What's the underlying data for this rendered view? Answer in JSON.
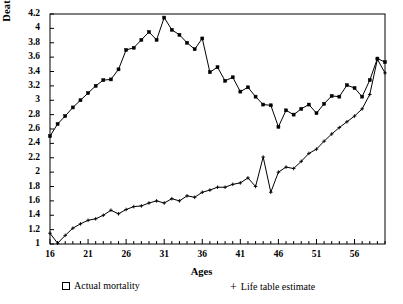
{
  "chart_data": {
    "type": "line",
    "title": "",
    "xlabel": "Ages",
    "ylabel": "Deaths  (thousands)",
    "xlim": [
      16,
      60
    ],
    "ylim": [
      1,
      4.2
    ],
    "ytick_step": 0.2,
    "xtick_step": 5,
    "grid": false,
    "legend_position": "below",
    "yticks": [
      "4.2",
      "4",
      "3.8",
      "3.6",
      "3.4",
      "3.2",
      "3",
      "2.8",
      "2.6",
      "2.4",
      "2.2",
      "2",
      "1.8",
      "1.6",
      "1.4",
      "1.2",
      "1"
    ],
    "xticks": [
      "16",
      "21",
      "26",
      "31",
      "36",
      "41",
      "46",
      "51",
      "56"
    ],
    "x": [
      16,
      17,
      18,
      19,
      20,
      21,
      22,
      23,
      24,
      25,
      26,
      27,
      28,
      29,
      30,
      31,
      32,
      33,
      34,
      35,
      36,
      37,
      38,
      39,
      40,
      41,
      42,
      43,
      44,
      45,
      46,
      47,
      48,
      49,
      50,
      51,
      52,
      53,
      54,
      55,
      56,
      57,
      58,
      59,
      60
    ],
    "series": [
      {
        "name": "Actual mortality",
        "marker": "square",
        "values": [
          2.5,
          2.67,
          2.78,
          2.9,
          3.0,
          3.1,
          3.2,
          3.28,
          3.29,
          3.43,
          3.7,
          3.73,
          3.84,
          3.95,
          3.84,
          4.15,
          3.98,
          3.91,
          3.8,
          3.71,
          3.86,
          3.39,
          3.46,
          3.27,
          3.32,
          3.12,
          3.18,
          3.05,
          2.94,
          2.93,
          2.63,
          2.86,
          2.8,
          2.88,
          2.94,
          2.82,
          2.95,
          3.06,
          3.05,
          3.21,
          3.17,
          3.05,
          3.28,
          3.58,
          3.53
        ]
      },
      {
        "name": "Life table estimate",
        "marker": "plus",
        "values": [
          1.15,
          1.01,
          1.12,
          1.22,
          1.28,
          1.33,
          1.35,
          1.4,
          1.47,
          1.42,
          1.48,
          1.52,
          1.53,
          1.57,
          1.6,
          1.57,
          1.63,
          1.6,
          1.67,
          1.65,
          1.72,
          1.75,
          1.79,
          1.79,
          1.83,
          1.85,
          1.92,
          1.8,
          2.21,
          1.72,
          2.0,
          2.07,
          2.05,
          2.15,
          2.26,
          2.32,
          2.43,
          2.53,
          2.62,
          2.7,
          2.78,
          2.88,
          3.08,
          3.57,
          3.38
        ]
      }
    ]
  },
  "legend": {
    "actual_label": "Actual mortality",
    "lifetable_label": "Life table estimate",
    "actual_marker": "open-square",
    "lifetable_marker": "plus-sign"
  },
  "style": {
    "line_color": "#000000",
    "axis_color": "#000000",
    "background": "#ffffff"
  }
}
